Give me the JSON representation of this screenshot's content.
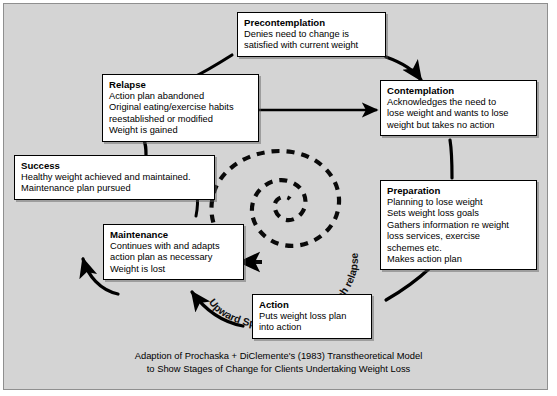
{
  "figure": {
    "background_color": "#d4d4d4",
    "border_color": "#8f8f8f",
    "box_fill": "#ffffff",
    "line_color": "#000000"
  },
  "stages": {
    "precontemplation": {
      "title": "Precontemplation",
      "lines": [
        "Denies need to change is",
        "satisfied with current weight"
      ]
    },
    "contemplation": {
      "title": "Contemplation",
      "lines": [
        "Acknowledges the need to",
        "lose weight and wants to lose",
        "weight but takes no action"
      ]
    },
    "preparation": {
      "title": "Preparation",
      "lines": [
        "Planning to lose weight",
        "Sets weight loss goals",
        "Gathers information re weight",
        "loss services, exercise",
        "schemes etc.",
        "Makes action plan"
      ]
    },
    "action": {
      "title": "Action",
      "lines": [
        "Puts weight loss plan",
        "into action"
      ]
    },
    "maintenance": {
      "title": "Maintenance",
      "lines": [
        "Continues with and adapts",
        "action plan as necessary",
        "Weight is lost"
      ]
    },
    "success": {
      "title": "Success",
      "lines": [
        "Healthy weight achieved and maintained.",
        "Maintenance plan pursued"
      ]
    },
    "relapse": {
      "title": "Relapse",
      "lines": [
        "Action plan abandoned",
        "Original eating/exercise habits",
        "reestablished or modified",
        "Weight is gained"
      ]
    }
  },
  "spiral": {
    "label": "Upward Spiral - Learn from each relapse",
    "label_chars": [
      "U",
      "p",
      "w",
      "a",
      "r",
      "d",
      " ",
      "S",
      "p",
      "i",
      "r",
      "a",
      "l",
      " ",
      "-",
      " ",
      "L",
      "e",
      "a",
      "r",
      "n",
      " ",
      "f",
      "r",
      "o",
      "m",
      " ",
      "e",
      "a",
      "c",
      "h",
      " ",
      "r",
      "e",
      "l",
      "a",
      "p",
      "s",
      "e"
    ]
  },
  "caption": {
    "line1": "Adaption of Prochaska + DiClemente's (1983) Transtheoretical Model",
    "line2": "to Show Stages of Change for Clients Undertaking Weight Loss"
  }
}
